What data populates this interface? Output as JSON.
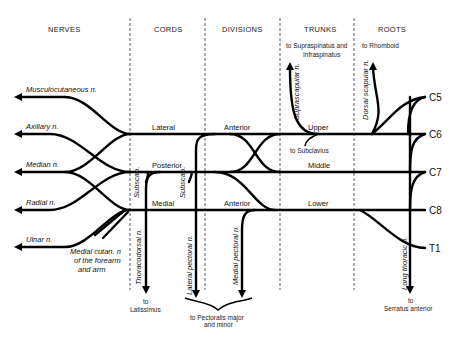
{
  "diagram": {
    "columns": [
      "NERVES",
      "CORDS",
      "DIVISIONS",
      "TRUNKS",
      "ROOTS"
    ],
    "roots": [
      "C5",
      "C6",
      "C7",
      "C8",
      "T1"
    ],
    "trunks": [
      "Upper",
      "Middle",
      "Lower"
    ],
    "divisions": [
      "Anterior",
      "Anterior"
    ],
    "cords": [
      "Lateral",
      "Posterior",
      "Medial"
    ],
    "terminal_nerves": [
      "Musculocutaneous n.",
      "Axillary n.",
      "Median n.",
      "Radial n.",
      "Ulnar n."
    ],
    "branches": {
      "suprascapular": "Suprascapular n.",
      "dorsal_scapular": "Dorsal scapular n.",
      "long_thoracic": "Long thoracic n.",
      "thoracodorsal": "Thoracodorsal n.",
      "lateral_pectoral": "Lateral pectoral n.",
      "medial_pectoral": "Medial pectoral n.",
      "subscap1": "Subscap.",
      "subscap2": "Subscap.",
      "medial_cutan_1": "Medial cutan. n",
      "medial_cutan_2": "of the forearm",
      "medial_cutan_3": "and arm"
    },
    "notes": {
      "supraspinatus_1": "to Supraspinatus and",
      "supraspinatus_2": "Infraspinatus",
      "rhomboid": "to Rhomboid",
      "subclavius": "to Subclavius",
      "latissimus_1": "to",
      "latissimus_2": "Latissimus",
      "pectoralis_1": "to Pectoralis major",
      "pectoralis_2": "and minor",
      "serratus_1": "to",
      "serratus_2": "Serratus anterior"
    }
  }
}
